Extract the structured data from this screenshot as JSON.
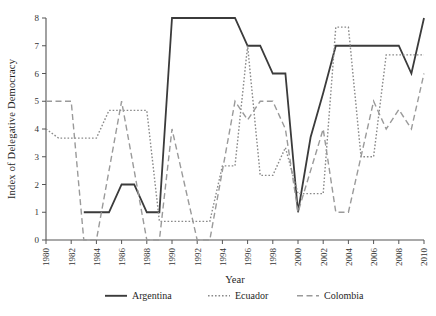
{
  "chart_data": {
    "type": "line",
    "title": "",
    "xlabel": "Year",
    "ylabel": "Index of Delegative Democracy",
    "xlim": [
      1980,
      2010
    ],
    "ylim": [
      0,
      8
    ],
    "grid": false,
    "legend_position": "bottom",
    "x_tick_labels": [
      "1980",
      "1982",
      "1984",
      "1986",
      "1988",
      "1990",
      "1992",
      "1994",
      "1996",
      "1998",
      "2000",
      "2002",
      "2004",
      "2006",
      "2008",
      "2010"
    ],
    "x_tick_values": [
      1980,
      1982,
      1984,
      1986,
      1988,
      1990,
      1992,
      1994,
      1996,
      1998,
      2000,
      2002,
      2004,
      2006,
      2008,
      2010
    ],
    "y_tick_labels": [
      "0",
      "1",
      "2",
      "3",
      "4",
      "5",
      "6",
      "7",
      "8"
    ],
    "y_tick_values": [
      0,
      1,
      2,
      3,
      4,
      5,
      6,
      7,
      8
    ],
    "x": [
      1980,
      1981,
      1982,
      1983,
      1984,
      1985,
      1986,
      1987,
      1988,
      1989,
      1990,
      1991,
      1992,
      1993,
      1994,
      1995,
      1996,
      1997,
      1998,
      1999,
      2000,
      2001,
      2002,
      2003,
      2004,
      2005,
      2006,
      2007,
      2008,
      2009,
      2010
    ],
    "series": [
      {
        "name": "Argentina",
        "style": "solid",
        "color": "#3b3b3b",
        "values": [
          null,
          null,
          null,
          1,
          1,
          1,
          2,
          2,
          1,
          1,
          8,
          8,
          8,
          8,
          8,
          8,
          7,
          7,
          6,
          6,
          1,
          3.7,
          5.3,
          7,
          7,
          7,
          7,
          7,
          7,
          6,
          8
        ]
      },
      {
        "name": "Ecuador",
        "style": "dotted",
        "color": "#8a8a8a",
        "values": [
          4,
          3.67,
          3.67,
          3.67,
          3.67,
          4.67,
          4.67,
          4.67,
          4.67,
          0.67,
          0.67,
          0.67,
          0.67,
          0.67,
          2.67,
          2.67,
          7,
          2.33,
          2.33,
          3.33,
          1.67,
          1.67,
          1.67,
          7.67,
          7.67,
          3,
          3,
          6.67,
          6.67,
          6.67,
          6.67
        ]
      },
      {
        "name": "Colombia",
        "style": "dashed",
        "color": "#9a9a9a",
        "values": [
          5,
          5,
          5,
          0,
          0,
          2.5,
          5,
          2.5,
          0,
          0,
          4,
          2,
          0,
          0,
          2.5,
          5,
          4.33,
          5,
          5,
          4,
          1,
          2.5,
          4,
          1,
          1,
          3,
          5,
          4,
          4.7,
          4,
          6
        ]
      }
    ]
  },
  "legend": {
    "items": [
      {
        "label": "Argentina",
        "style": "solid"
      },
      {
        "label": "Ecuador",
        "style": "dotted"
      },
      {
        "label": "Colombia",
        "style": "dashed"
      }
    ]
  }
}
